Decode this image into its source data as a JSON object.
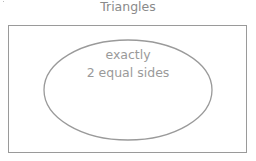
{
  "diagram": {
    "type": "venn",
    "universe_label": "Triangles",
    "sets": [
      {
        "label_line1": "exactly",
        "label_line2": "2 equal sides"
      }
    ],
    "colors": {
      "text": "#8a8a8a",
      "stroke": "#9a9a9a"
    }
  }
}
